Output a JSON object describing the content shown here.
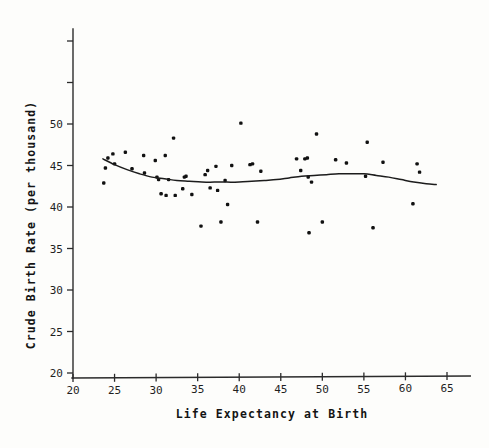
{
  "chart_data": {
    "type": "scatter",
    "title": "",
    "xlabel": "Life Expectancy at Birth",
    "ylabel": "Crude Birth Rate (per thousand)",
    "xlim": [
      20,
      68
    ],
    "ylim": [
      19,
      62
    ],
    "xticks": [
      20,
      25,
      30,
      35,
      40,
      45,
      50,
      55,
      60,
      65
    ],
    "xticklabels": [
      "20",
      "25",
      "30",
      "35",
      "40",
      "45",
      "50",
      "55",
      "60",
      "65"
    ],
    "yticks": [
      20,
      25,
      30,
      35,
      40,
      45,
      50,
      55,
      60
    ],
    "yticklabels": [
      "20",
      "25",
      "30",
      "35",
      "40",
      "45",
      "50",
      "",
      ""
    ],
    "grid": false,
    "legend": null,
    "marker": "square-dot",
    "series": [
      {
        "name": "countries",
        "points": [
          [
            23.7,
            42.9
          ],
          [
            23.9,
            44.7
          ],
          [
            24.2,
            45.9
          ],
          [
            24.8,
            46.4
          ],
          [
            25.0,
            45.2
          ],
          [
            26.3,
            46.6
          ],
          [
            27.1,
            44.6
          ],
          [
            28.5,
            46.2
          ],
          [
            28.6,
            44.1
          ],
          [
            29.9,
            45.6
          ],
          [
            30.1,
            43.6
          ],
          [
            30.3,
            43.3
          ],
          [
            30.6,
            41.6
          ],
          [
            31.1,
            46.2
          ],
          [
            31.2,
            41.4
          ],
          [
            31.5,
            43.3
          ],
          [
            32.1,
            48.3
          ],
          [
            32.3,
            41.4
          ],
          [
            33.2,
            42.2
          ],
          [
            33.4,
            43.6
          ],
          [
            33.6,
            43.7
          ],
          [
            34.3,
            41.5
          ],
          [
            35.4,
            37.7
          ],
          [
            35.9,
            43.9
          ],
          [
            36.2,
            44.4
          ],
          [
            36.5,
            42.3
          ],
          [
            37.2,
            44.9
          ],
          [
            37.4,
            42.0
          ],
          [
            37.8,
            38.2
          ],
          [
            38.3,
            43.2
          ],
          [
            38.6,
            40.3
          ],
          [
            39.1,
            45.0
          ],
          [
            40.2,
            50.1
          ],
          [
            41.3,
            45.1
          ],
          [
            41.6,
            45.2
          ],
          [
            42.2,
            38.2
          ],
          [
            42.6,
            44.3
          ],
          [
            46.9,
            45.8
          ],
          [
            47.4,
            44.4
          ],
          [
            47.9,
            45.8
          ],
          [
            48.2,
            45.9
          ],
          [
            48.3,
            43.6
          ],
          [
            48.4,
            36.9
          ],
          [
            48.7,
            43.0
          ],
          [
            49.3,
            48.8
          ],
          [
            50.0,
            38.2
          ],
          [
            51.6,
            45.7
          ],
          [
            52.9,
            45.3
          ],
          [
            55.2,
            43.7
          ],
          [
            55.4,
            47.8
          ],
          [
            56.1,
            37.5
          ],
          [
            57.3,
            45.4
          ],
          [
            60.9,
            40.4
          ],
          [
            61.4,
            45.2
          ],
          [
            61.7,
            44.2
          ]
        ]
      }
    ],
    "smoother": {
      "name": "lowess-trend",
      "points": [
        [
          23.6,
          45.8
        ],
        [
          25.0,
          45.1
        ],
        [
          26.5,
          44.5
        ],
        [
          28.0,
          44.0
        ],
        [
          29.5,
          43.6
        ],
        [
          31.0,
          43.4
        ],
        [
          32.5,
          43.2
        ],
        [
          34.0,
          43.1
        ],
        [
          35.5,
          43.0
        ],
        [
          37.0,
          43.0
        ],
        [
          38.5,
          43.0
        ],
        [
          40.0,
          43.0
        ],
        [
          41.5,
          43.1
        ],
        [
          43.0,
          43.2
        ],
        [
          44.5,
          43.3
        ],
        [
          46.0,
          43.5
        ],
        [
          47.5,
          43.7
        ],
        [
          49.0,
          43.8
        ],
        [
          50.5,
          43.9
        ],
        [
          52.0,
          44.0
        ],
        [
          53.5,
          44.0
        ],
        [
          55.0,
          44.0
        ],
        [
          56.5,
          43.8
        ],
        [
          58.0,
          43.6
        ],
        [
          59.5,
          43.3
        ],
        [
          61.0,
          43.0
        ],
        [
          62.5,
          42.8
        ],
        [
          63.7,
          42.7
        ]
      ]
    }
  },
  "colors": {
    "point": "#111111",
    "curve": "#1c1c1c",
    "axis": "#2b2b2b",
    "background": "#fdfdfb"
  }
}
